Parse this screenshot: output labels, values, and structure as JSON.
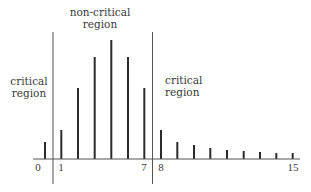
{
  "chart_data": {
    "type": "bar",
    "title": "",
    "xlabel": "",
    "ylabel": "",
    "grid": false,
    "style": "stem",
    "bar_color": "#2b2b2b",
    "boundary_color": "#555555",
    "values": [
      17,
      29,
      71,
      102,
      119,
      102,
      71,
      29,
      17,
      14,
      11,
      9,
      8,
      7,
      6,
      6
    ],
    "x_positions": [
      45,
      61.3,
      78,
      94.7,
      111.3,
      128,
      144.3,
      161,
      177.3,
      194,
      210.3,
      227,
      243.7,
      260,
      276.3,
      292.7
    ],
    "tick_labels": [
      {
        "text": "0",
        "x": 38
      },
      {
        "text": "1",
        "x": 61
      },
      {
        "text": "7",
        "x": 144
      },
      {
        "text": "8",
        "x": 161
      },
      {
        "text": "15",
        "x": 293
      }
    ],
    "boundaries": [
      53,
      152.5
    ],
    "regions": [
      {
        "name": "left-critical",
        "label": "critical\nregion",
        "x": 29,
        "y": 75,
        "align": "center"
      },
      {
        "name": "non-critical",
        "label": "non-critical\nregion",
        "x": 100,
        "y": 6,
        "align": "center"
      },
      {
        "name": "right-critical",
        "label": "critical\nregion",
        "x": 165,
        "y": 74,
        "align": "left"
      }
    ],
    "axis_y": 159,
    "axis_x_range": [
      33,
      300
    ]
  }
}
